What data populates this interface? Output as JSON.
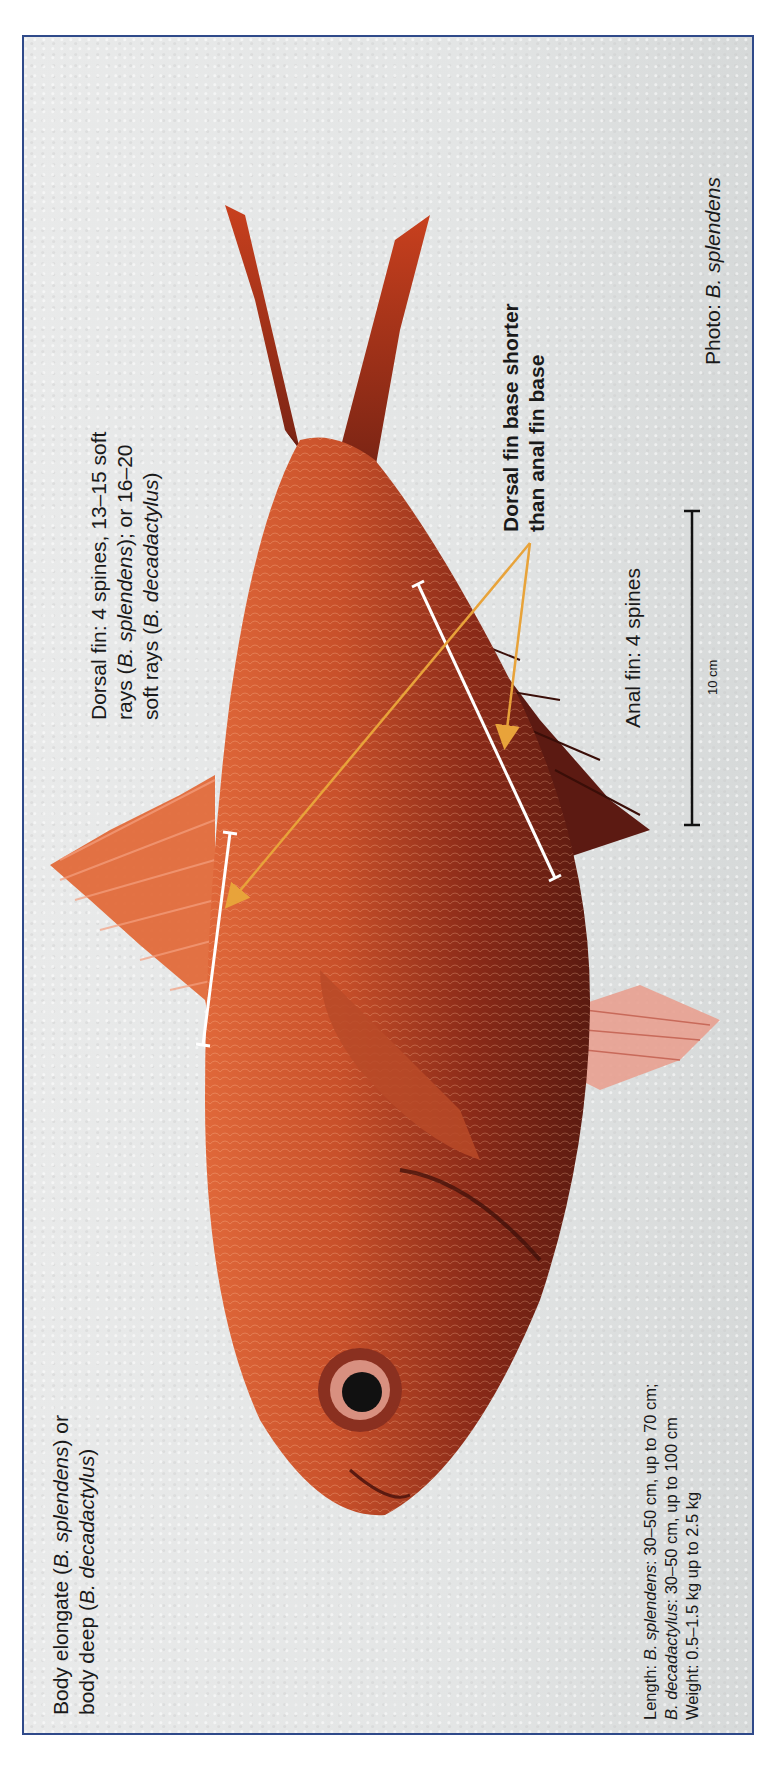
{
  "figure": {
    "border_color": "#2f4a8a",
    "annotation_arrow_color": "#e8a33a",
    "measurement_bar_color": "#ffffff"
  },
  "labels": {
    "body_shape": {
      "line1_pre": "Body elongate (",
      "line1_italic": "B. splendens",
      "line1_post": ") or",
      "line2_pre": "body deep (",
      "line2_italic": "B. decadactylus",
      "line2_post": ")"
    },
    "dorsal_fin": {
      "line1": "Dorsal fin: 4 spines, 13–15 soft",
      "line2_pre": "rays (",
      "line2_italic": "B. splendens",
      "line2_post": "); or 16–20",
      "line3_pre": "soft rays (",
      "line3_italic": "B. decadactylus",
      "line3_post": ")"
    },
    "fin_base_comparison": {
      "line1": "Dorsal fin base shorter",
      "line2": "than anal fin base"
    },
    "anal_fin": "Anal fin: 4 spines",
    "scale_bar": "10 cm",
    "photo_credit": {
      "pre": "Photo: ",
      "italic": "B. splendens"
    },
    "size_info": {
      "line1_pre": "Length: ",
      "line1_italic": "B. splendens",
      "line1_post": ": 30–50 cm, up to 70 cm;",
      "line2_italic": "B. decadactylus",
      "line2_post": ": 30–50 cm, up to 100 cm",
      "line3": "Weight: 0.5–1.5 kg up to 2.5 kg"
    }
  }
}
